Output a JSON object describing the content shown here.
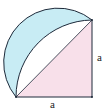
{
  "diagram": {
    "type": "geometry",
    "labels": {
      "bottom_leg": "a",
      "right_leg": "a"
    },
    "colors": {
      "lune_fill": "#c8ecf4",
      "triangle_fill": "#f8e0ea",
      "stroke": "#1e2a3a",
      "background": "#ffffff"
    },
    "points": {
      "bottom_left": [
        16,
        97
      ],
      "bottom_right": [
        92,
        97
      ],
      "top_right": [
        92,
        20
      ]
    }
  }
}
